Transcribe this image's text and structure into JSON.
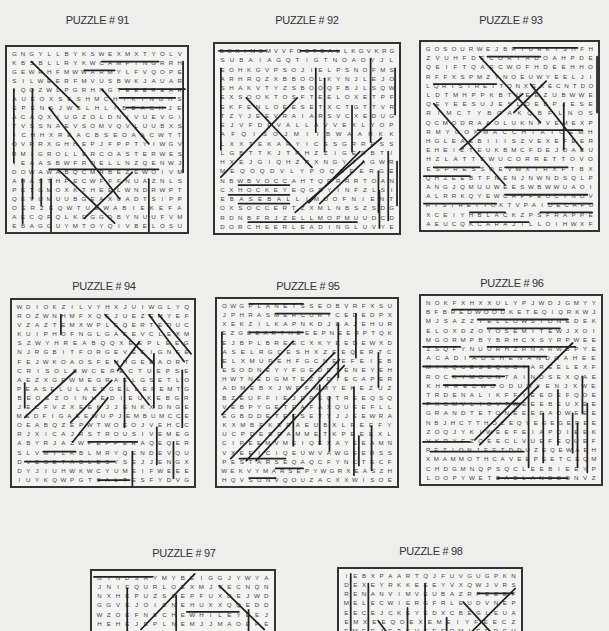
{
  "puzzles": [
    {
      "title": "PUZZLE # 91",
      "rows": [
        "GNGYLLBYKSWEXMXTYOLV",
        "KBSBLLRYKWCAMPINGRRH",
        "GEWRHFMWWARMYLFVQOPE",
        "SILWEERFMVUSBWKJAUAR",
        "IQOZWLPGRHNGTEEEREAR",
        "AUEOXSESHMCHIKINGHS",
        "EPENSJWSLHLIBEACHJE",
        "ACAQXIUGZOLDNIVUEVGI",
        "TVSSNAEVSOMVQVLUUBXS",
        "ICHHXREACBSEOAACWTT",
        "OVRRXGHHEPJFPPTYIWGV",
        "RMIGROLLERCOASTERWES",
        "IEAASBWFRQELLNZQENWJ",
        "DOWAWABQCMRBEZEWOIVM",
        "AHASTHPECWFFFNUAZNLS",
        "PETGMOXKTHEELWNDRWPT",
        "QEVUMUUBGEAXUADTSIPP",
        "OERZEQWTUEWABIEKEFA",
        "AECQRQLKEGGDBYNUUFVM",
        "EBAGGUYMTOYQIVBELOSU"
      ],
      "strike_count": 18
    },
    {
      "title": "PUZZLE # 92",
      "rows": [
        "BOXINGMVVFOOTBALLKGVKRG",
        "SUBAIAGQTIGTNOAOYJL",
        "EOHKGVPSOJIELPSNOFMS",
        "ARHRQZXBBOOLKYNJLEJO",
        "SHAKVTYZSBOOQFBJLSQW",
        "EXSOOKTOSFTEELOXETPF",
        "EKFENLOEESETXCTGTTVR",
        "TZYJEEVRAIARSVCXEDUG",
        "EJVFDEVALLAVVEXLYOP",
        "AFQISOJMIIBWAARKK",
        "LXXTEKARYICSSGRRESS",
        "LGBTTKJTRHZZIGEDBTI",
        "HXEJGIQHZRXNGYIAGWR",
        "MEQOQDVLYPOQXEERGE",
        "NBWBVOCCAHTQRRRRTOAN",
        "CXHOCKEYEQGDYINFZLSI",
        "EBASEBALLIMOOFNIENT",
        "OXSOCCERTZXMLNBSZSDG",
        "RDNBFRJZELLMOPMUUDCD",
        "DORCHEERLEADINGLUVYE"
      ],
      "strike_count": 21
    },
    {
      "title": "PUZZLE # 93",
      "rows": [
        "GOSOURWEJBRTURKISHFH",
        "ZVUHFDFCORTADOAHPDE",
        "QEIFTQAECWOFHDEEHHO",
        "RFFXSPMZTNOEUWYEELJI",
        "LQRISTRETTONXEXECNTDO",
        "LDTMHPPKBTUEEZUBWWE",
        "QEYEESUJESLOEBPJESE",
        "RIMCTYBOAKQBFLNOS",
        "QCMODRAAOLUKNFVEMEXP",
        "RMYGOKMACCHIATOEMH",
        "HGLEAEBIIISZVEXEFEER",
        "EHEIZTEUKBMCFDEJOAEU",
        "HZLATTEWUCORRETTOVO",
        "ESPRESSOEVWXTRXFTBX",
        "QHZEEBTFNENJNWNDSQLP",
        "ANGJQMUUWEESWBWWUAOI",
        "ALRRKQYEWCAFFEOCINOV",
        "RISTRETTOKTVPAIDECAFO",
        "XCEIYHBLACKZPSFRAPPE",
        "AEUCQKCARAJILLOIHWXF"
      ],
      "strike_count": 22
    },
    {
      "title": "PUZZLE # 94",
      "rows": [
        "WDIOKZILVYHXJUIWGLYQ",
        "ROZWNHMFXQEJUEZEMYEF",
        "VZAZTEMXWPLEQERTEDUC",
        "KUIPHOFNGLGAEEVCLEXM",
        "SZWYHREABQQXEEPLEEG",
        "NJRGBITFORGEVEEIGNEE",
        "FEJWKOAOSFEHHGEEAORT",
        "CRISOLEWCERECTUEPSE",
        "AEZXGEWMEGRAELGSETLO",
        "PEASELULAEEGELLEPEMTG",
        "BEOEZOINHEDIEUKEBGR",
        "JECFVZXEEKJJENKXDNGE",
        "MEDFIGAEEWUPJEMBUMCCE",
        "OEABQZEPWTWOEOJVEHCC",
        "RJXICAJRSTROUSIVEMEG",
        "ABYRJAZWPEPPERAQEQER",
        "SLVMILKBLMRYQENDEVQU",
        "DVEGETABLESYSEJJENGX",
        "DYJIUHWKWCYUMEIFWEEE",
        "IUYKQWPGTSALTESFYDVG"
      ],
      "strike_count": 24
    },
    {
      "title": "PUZZLE # 95",
      "rows": [
        "OWGPLANETSSEOBVRFXSU",
        "JPHRASMERCURYCEDEDPX",
        "XEKZILKAPNKDJEAJEHUR",
        "EZGEEARTHEEEPNEERPTQK",
        "EJBPLBREECXKYEEDEWXD",
        "ASELRGCESHXZEEQERTC",
        "ELXMUPEHFGCNEEFEIEB",
        "ESODNEYYFGEDETENEYEH",
        "HWTNEDGMTEZEDIECAPER",
        "ADMEBXJWEFNMYEKEZUZ",
        "BZEUFFIEJEPEQTREEQSQ",
        "VEBPYGETEAFAXQUEEFLL",
        "EGBDDETEESETYJJEEWRA",
        "KXMBFKERAEUBXLREEFY",
        "UCPDEERAMMETKPEEEXL",
        "CIPEEMVMEIQEXAYEEAMN",
        "VXEEICIQEUWVAWGEERSS",
        "PESTARSEQAQCFYNCTECF",
        "WEKVYMARSEPYWGRXEASZH",
        "HQVSUNVQOUZACXXWISOE"
      ],
      "strike_count": 24
    },
    {
      "title": "PUZZLE # 96",
      "rows": [
        "NOKFXHXXULYPJWDJGMYY",
        "BFBREDWOODKETEQIQRKWJ",
        "MJSAZZYELLOWSTONEDEK",
        "ELOXDZOYOSEMITEWJXOI",
        "MGORMPBYBRHCXSYRPWEE",
        "ZSQFYNUURHZRNARWBPYE",
        "ACADIADSHENANDOAHEE",
        "MYKQUESEQUOIAREELEXF",
        "ROCKYMOUNTAINDSEXQAE",
        "KHRREDWOODUWYENJXWE",
        "TRDENALIKFFYEEDEFQOE",
        "PXCMVLIOVTWEEEBEUXEE",
        "GRANDTETONEEEEAOWEEE",
        "NBJHCTTHOZEQYEGEGEREE",
        "ZOQJYKIWEEFEIAPOIEEK",
        "VKRYFZQEECLVUEFEQUEF",
        "REZIONJEETDDUZEQEWAEH",
        "XMAMMOTHCAVEEPEETCEQM",
        "CHDGMNQPSQCLEEBIEEYP",
        "LOOPYWETBADLANDSONVZ"
      ],
      "strike_count": 24
    },
    {
      "title": "PUZZLE # 97",
      "rows": [
        "GINDSAYMYBEIGGJYWYA",
        "JNIEQURLOEXMJVECNQN",
        "NXHEPUZSEEPFUXDEJWD",
        "GGVEJOIENEHUXXQQEDD",
        "WZOEFNECHEWHILEYEEJ",
        "HEHEJEPLNEMJJMAOEPE",
        "VRIEACTVTEEEHNTCEJR"
      ]
    },
    {
      "title": "PUZZLE # 98",
      "rows": [
        "IEBXPAARTQJFUVGUGPKN",
        "DEXEYRKKEEEYVXQWJVRS",
        "RENANVIMVEUBAZRPEEEF",
        "MELECWIERGFRLEUDVNEP",
        "EECEJCKEYEDXCBEGLEUA",
        "EMXEEQOEXEMEIYFEECZ",
        "EMFEJETEVEEEOMIEEDCU"
      ]
    }
  ]
}
